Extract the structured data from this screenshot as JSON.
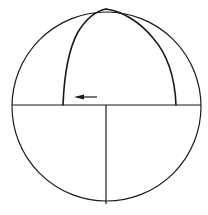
{
  "diagram": {
    "colors": {
      "line": "#1a1a1a",
      "background": "#ffffff"
    },
    "elements": [
      {
        "id": "outer-circle",
        "kind": "circle"
      },
      {
        "id": "equator",
        "kind": "line"
      },
      {
        "id": "lower-meridian",
        "kind": "line"
      },
      {
        "id": "left-arc",
        "kind": "arc"
      },
      {
        "id": "right-arc",
        "kind": "arc"
      },
      {
        "id": "direction-arrow",
        "kind": "arrow",
        "direction": "left"
      }
    ]
  }
}
